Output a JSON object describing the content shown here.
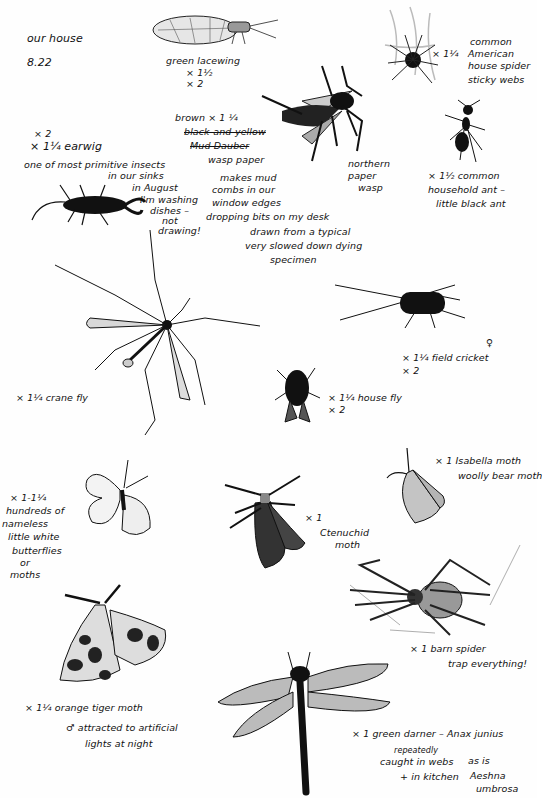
{
  "page": {
    "title": "our house",
    "date": "8.22"
  },
  "specimens": [
    {
      "id": "green-lacewing",
      "lines": [
        "green lacewing",
        "× 1½",
        "× 2"
      ]
    },
    {
      "id": "american-house-spider",
      "scale": "× 1¼",
      "lines": [
        "common",
        "American",
        "house spider",
        "sticky webs"
      ]
    },
    {
      "id": "northern-paper-wasp",
      "lines": [
        "northern",
        "paper",
        "wasp"
      ]
    },
    {
      "id": "wasp-paper-note",
      "lines": [
        "brown × 1 ¼",
        "black-and-yellow",
        "Mud Dauber",
        "wasp paper",
        "makes mud",
        "combs in our",
        "window edges",
        "dropping bits on my desk",
        "drawn from a typical",
        "very slowed down dying",
        "specimen"
      ],
      "struck": [
        1,
        2
      ]
    },
    {
      "id": "earwig",
      "lines": [
        "× 2",
        "× 1¼ earwig",
        "one of most primitive insects",
        "in our sinks",
        "in August",
        "I'm washing",
        "dishes –",
        "not",
        "drawing!"
      ]
    },
    {
      "id": "common-household-ant",
      "lines": [
        "× 1½ common",
        "household ant –",
        "little black ant"
      ]
    },
    {
      "id": "field-cricket",
      "lines": [
        "♀",
        "× 1¼ field cricket",
        "× 2"
      ]
    },
    {
      "id": "house-fly",
      "lines": [
        "× 1¼ house fly",
        "× 2"
      ]
    },
    {
      "id": "crane-fly",
      "lines": [
        "× 1¼ crane fly"
      ]
    },
    {
      "id": "white-butterflies",
      "lines": [
        "× 1-1¼",
        "hundreds of",
        "nameless",
        "little white",
        "butterflies",
        "or",
        "moths"
      ]
    },
    {
      "id": "ctenuchid-moth",
      "lines": [
        "× 1",
        "Ctenuchid",
        "moth"
      ]
    },
    {
      "id": "isabella-moth",
      "lines": [
        "× 1 Isabella moth",
        "woolly bear moth"
      ]
    },
    {
      "id": "barn-spider",
      "lines": [
        "× 1 barn spider",
        "trap everything!"
      ]
    },
    {
      "id": "orange-tiger-moth",
      "lines": [
        "× 1¼ orange tiger moth",
        "♂ attracted to artificial",
        "lights at night"
      ]
    },
    {
      "id": "green-darner",
      "lines": [
        "× 1 green darner – Anax junius",
        "repeatedly",
        "caught in webs",
        "+ in kitchen",
        "as is",
        "Aeshna",
        "umbrosa"
      ]
    }
  ]
}
